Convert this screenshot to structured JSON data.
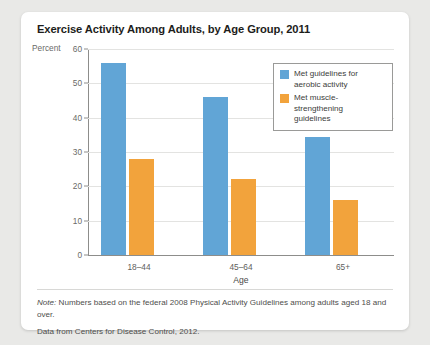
{
  "chart_data": {
    "type": "bar",
    "title": "Exercise Activity Among Adults, by Age Group, 2011",
    "categories": [
      "18–44",
      "45–64",
      "65+"
    ],
    "series": [
      {
        "name": "Met guidelines for aerobic activity",
        "values": [
          56,
          46,
          34.5
        ],
        "color": "#61a5d6"
      },
      {
        "name": "Met muscle-strengthening guidelines",
        "values": [
          28,
          22,
          16
        ],
        "color": "#f2a33c"
      }
    ],
    "xlabel": "Age",
    "ylabel": "Percent",
    "ylim": [
      0,
      60
    ],
    "yticks": [
      60,
      50,
      40,
      30,
      20,
      10,
      0
    ],
    "grid": true,
    "legend_position": "top-right"
  },
  "legend": {
    "items": [
      {
        "label_line1": "Met guidelines for",
        "label_line2": "aerobic activity"
      },
      {
        "label_line1": "Met muscle-strengthening",
        "label_line2": "guidelines"
      }
    ]
  },
  "notes": {
    "note_prefix": "Note:",
    "note_body": " Numbers based on the federal 2008 Physical Activity Guidelines among adults aged 18 and over.",
    "source": "Data from Centers for Disease Control, 2012."
  }
}
